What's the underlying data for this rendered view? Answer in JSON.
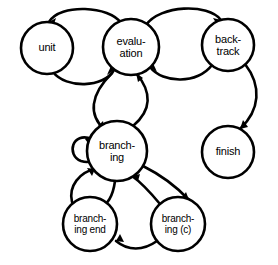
{
  "diagram": {
    "background_color": "#ffffff",
    "line_color": "#000000",
    "width": 278,
    "height": 265
  },
  "nodes": [
    {
      "id": "unit",
      "label": "unit",
      "cx": 47,
      "cy": 48,
      "r": 26
    },
    {
      "id": "evaluation",
      "label": "evalu-\nation",
      "cx": 131,
      "cy": 47,
      "r": 28
    },
    {
      "id": "backtrack",
      "label": "back-\ntrack",
      "cx": 228,
      "cy": 45,
      "r": 26
    },
    {
      "id": "finish",
      "label": "finish",
      "cx": 228,
      "cy": 152,
      "r": 26
    },
    {
      "id": "branching",
      "label": "branch-\ning",
      "cx": 117,
      "cy": 151,
      "r": 30
    },
    {
      "id": "branching_end",
      "label": "branch-\ning end",
      "cx": 90,
      "cy": 224,
      "r": 27
    },
    {
      "id": "branching_c",
      "label": "branch-\ning (c)",
      "cx": 178,
      "cy": 224,
      "r": 27
    }
  ],
  "edges": [
    {
      "id": "evaluation-to-unit",
      "from": "evaluation",
      "to": "unit",
      "style": "curved-arc"
    },
    {
      "id": "unit-to-evaluation",
      "from": "unit",
      "to": "evaluation",
      "style": "curved-arc"
    },
    {
      "id": "evaluation-to-backtrack",
      "from": "evaluation",
      "to": "backtrack",
      "style": "curved-arc"
    },
    {
      "id": "backtrack-to-evaluation",
      "from": "backtrack",
      "to": "evaluation",
      "style": "curved-arc"
    },
    {
      "id": "backtrack-to-finish",
      "from": "backtrack",
      "to": "finish",
      "style": "curved-arc"
    },
    {
      "id": "evaluation-to-branching",
      "from": "evaluation",
      "to": "branching",
      "style": "curved-arc"
    },
    {
      "id": "branching-to-evaluation",
      "from": "branching",
      "to": "evaluation",
      "style": "curved-arc"
    },
    {
      "id": "branching-self-loop",
      "from": "branching",
      "to": "branching",
      "style": "self-loop"
    },
    {
      "id": "branching-to-branching-end",
      "from": "branching",
      "to": "branching_end",
      "style": "curved-arc"
    },
    {
      "id": "branching-end-to-branching",
      "from": "branching_end",
      "to": "branching",
      "style": "curved-arc"
    },
    {
      "id": "branching-to-branching-c",
      "from": "branching",
      "to": "branching_c",
      "style": "curved-arc"
    },
    {
      "id": "branching-c-to-branching",
      "from": "branching_c",
      "to": "branching",
      "style": "curved-arc"
    },
    {
      "id": "branching-c-to-branching-end",
      "from": "branching_c",
      "to": "branching_end",
      "style": "curved-arc"
    }
  ]
}
